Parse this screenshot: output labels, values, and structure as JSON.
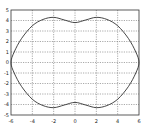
{
  "chart_data": {
    "type": "line",
    "title": "",
    "xlabel": "",
    "ylabel": "",
    "xlim": [
      -6,
      6
    ],
    "ylim": [
      -5,
      5
    ],
    "grid": true,
    "grid_style": "dotted",
    "legend": null,
    "x_ticks": [
      -6,
      -4,
      -2,
      0,
      2,
      4,
      6
    ],
    "y_ticks": [
      5,
      4,
      3,
      2,
      1,
      0,
      -1,
      -2,
      -3,
      -4,
      -5
    ],
    "series": [
      {
        "name": "closed curve (peanut-shaped oval)",
        "color": "#333333",
        "points": [
          [
            0,
            3.8
          ],
          [
            1,
            4.05
          ],
          [
            2,
            4.3
          ],
          [
            3,
            4.1
          ],
          [
            4,
            3.5
          ],
          [
            5,
            2.3
          ],
          [
            5.7,
            1.0
          ],
          [
            6,
            0
          ],
          [
            5.7,
            -1.0
          ],
          [
            5,
            -2.3
          ],
          [
            4,
            -3.5
          ],
          [
            3,
            -4.1
          ],
          [
            2,
            -4.3
          ],
          [
            1,
            -4.05
          ],
          [
            0,
            -3.8
          ],
          [
            -1,
            -4.05
          ],
          [
            -2,
            -4.3
          ],
          [
            -3,
            -4.1
          ],
          [
            -4,
            -3.5
          ],
          [
            -5,
            -2.3
          ],
          [
            -5.7,
            -1.0
          ],
          [
            -6,
            0
          ],
          [
            -5.7,
            1.0
          ],
          [
            -5,
            2.3
          ],
          [
            -4,
            3.5
          ],
          [
            -3,
            4.1
          ],
          [
            -2,
            4.3
          ],
          [
            -1,
            4.05
          ],
          [
            0,
            3.8
          ]
        ]
      }
    ]
  }
}
